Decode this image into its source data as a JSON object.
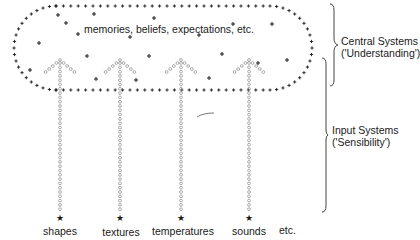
{
  "diagram": {
    "central": {
      "contents_label": "memories, beliefs, expectations, etc.",
      "side_label_line1": "Central Systems",
      "side_label_line2": "('Understanding')"
    },
    "input": {
      "side_label_line1": "Input Systems",
      "side_label_line2": "('Sensibility')"
    },
    "inputs": [
      {
        "label": "shapes",
        "x": 60
      },
      {
        "label": "textures",
        "x": 120
      },
      {
        "label": "temperatures",
        "x": 181
      },
      {
        "label": "sounds",
        "x": 249
      }
    ],
    "trailing_label": "etc.",
    "symbols": {
      "boundary_marker": "+",
      "central_content_marker": "+",
      "input_path_marker": "o",
      "source_marker": "star"
    },
    "colors": {
      "ink": "#1a1a1a",
      "path": "#8a8a8a",
      "bracket": "#444444"
    }
  }
}
